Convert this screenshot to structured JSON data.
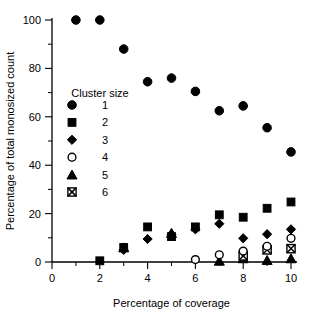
{
  "chart_data": {
    "type": "scatter",
    "title": "",
    "xlabel": "Percentage of coverage",
    "ylabel": "Percentage of total monosized count",
    "xlim": [
      0,
      10
    ],
    "ylim": [
      0,
      100
    ],
    "xticks": [
      0,
      2,
      4,
      6,
      8,
      10
    ],
    "xticklabels": [
      "0",
      "2",
      "4",
      "6",
      "8",
      "10"
    ],
    "xminorticks": [
      1,
      3,
      5,
      7,
      9
    ],
    "yticks": [
      0,
      20,
      40,
      60,
      80,
      100
    ],
    "yticklabels": [
      "0",
      "20",
      "40",
      "60",
      "80",
      "100"
    ],
    "yminorticks": [
      10,
      30,
      50,
      70,
      90
    ],
    "grid": false,
    "legend_title": "Cluster size",
    "legend_position": "inside-upper-left",
    "series": [
      {
        "name": "1",
        "marker": "filled-circle",
        "color": "#000000",
        "x": [
          1,
          2,
          3,
          4,
          5,
          6,
          7,
          8,
          9,
          10
        ],
        "y": [
          100,
          100,
          88,
          74.5,
          76,
          70.5,
          62.5,
          64.5,
          55.5,
          45.5
        ]
      },
      {
        "name": "2",
        "marker": "filled-square",
        "color": "#000000",
        "x": [
          2,
          3,
          4,
          5,
          6,
          7,
          8,
          9,
          10
        ],
        "y": [
          0.5,
          6,
          14.5,
          10.5,
          14.5,
          19.5,
          18.5,
          22.2,
          24.8
        ]
      },
      {
        "name": "3",
        "marker": "filled-diamond",
        "color": "#000000",
        "x": [
          3,
          4,
          5,
          6,
          7,
          8,
          9,
          10
        ],
        "y": [
          5,
          9.5,
          11.5,
          13.5,
          15.8,
          9.8,
          11.5,
          13.5
        ]
      },
      {
        "name": "4",
        "marker": "open-circle",
        "color": "#000000",
        "x": [
          6,
          7,
          8,
          9,
          10
        ],
        "y": [
          1,
          3,
          4.5,
          6.5,
          9.8
        ]
      },
      {
        "name": "5",
        "marker": "filled-triangle",
        "color": "#000000",
        "x": [
          3,
          5,
          7,
          8,
          9,
          10
        ],
        "y": [
          6,
          12,
          0.5,
          1.5,
          0.8,
          1.5
        ]
      },
      {
        "name": "6",
        "marker": "crossed-square",
        "color": "#000000",
        "x": [
          8,
          9,
          10
        ],
        "y": [
          2.5,
          5,
          5.5
        ]
      }
    ]
  }
}
